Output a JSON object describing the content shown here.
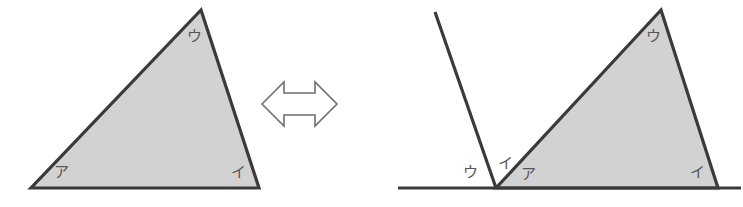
{
  "figure": {
    "background_color": "#ffffff",
    "stroke_color": "#3a3a3a",
    "fill_color": "#d2d2d2",
    "label_color": "#555555",
    "arrow_color": "#6e6e6e",
    "relation_symbol_name": "double-headed-arrow"
  },
  "left_figure": {
    "name": "original-triangle",
    "fill_color": "#d2d2d2",
    "stroke_color": "#3a3a3a",
    "vertices": {
      "bottom_left": [
        31,
        188
      ],
      "bottom_right": [
        259,
        188
      ],
      "apex": [
        201,
        10
      ]
    },
    "labels": {
      "bottom_left": "ア",
      "bottom_right": "イ",
      "apex": "ウ"
    },
    "label_positions": {
      "bottom_left": [
        61,
        172
      ],
      "bottom_right": [
        238,
        172
      ],
      "apex": [
        194,
        36
      ]
    }
  },
  "right_figure": {
    "name": "angles-on-straight-line",
    "fill_color": "#d2d2d2",
    "stroke_color": "#3a3a3a",
    "baseline": {
      "name": "straight-line",
      "start": [
        398,
        188
      ],
      "end": [
        741,
        188
      ]
    },
    "ray": {
      "name": "transferred-angle-ray",
      "start": [
        496,
        188
      ],
      "end": [
        435,
        12
      ]
    },
    "triangle_vertices": {
      "bottom_left": [
        496,
        188
      ],
      "bottom_right": [
        718,
        188
      ],
      "apex": [
        661,
        10
      ]
    },
    "labels": {
      "outer_left": "ウ",
      "middle": "イ",
      "inner_right": "ア",
      "triangle_bottom_right": "イ",
      "triangle_apex": "ウ"
    },
    "label_positions": {
      "outer_left": [
        470,
        172
      ],
      "middle": [
        504,
        164
      ],
      "inner_right": [
        527,
        174
      ],
      "triangle_bottom_right": [
        697,
        172
      ],
      "triangle_apex": [
        653,
        36
      ]
    }
  },
  "relation_arrow": {
    "name": "double-headed-arrow",
    "stroke_color": "#6e6e6e",
    "fill_color": "#ffffff",
    "left_tip_x": 262,
    "right_tip_x": 337,
    "center_y": 104
  }
}
